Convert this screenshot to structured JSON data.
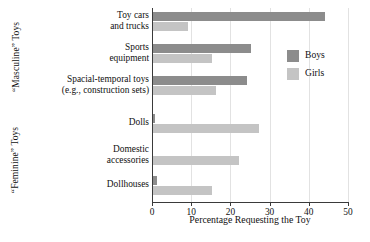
{
  "chart_data": {
    "type": "bar",
    "orientation": "horizontal",
    "title": "",
    "xlabel": "Percentage Requesting the Toy",
    "ylabel": "",
    "xlim": [
      0,
      50
    ],
    "xticks": [
      0,
      10,
      20,
      30,
      40,
      50
    ],
    "grid": true,
    "legend_position": "inside-right",
    "categories": [
      "Toy cars and trucks",
      "Sports equipment",
      "Spacial-temporal toys (e.g., construction sets)",
      "Dolls",
      "Domestic accessories",
      "Dollhouses"
    ],
    "series": [
      {
        "name": "Boys",
        "color": "#8c8c8c",
        "values": [
          44,
          25,
          24,
          0.5,
          0,
          1
        ]
      },
      {
        "name": "Girls",
        "color": "#c4c4c4",
        "values": [
          9,
          15,
          16,
          27,
          22,
          15
        ]
      }
    ]
  },
  "axis": {
    "xlabel": "Percentage Requesting the Toy",
    "ticks": [
      {
        "value": 0,
        "label": "0"
      },
      {
        "value": 10,
        "label": "10"
      },
      {
        "value": 20,
        "label": "20"
      },
      {
        "value": 30,
        "label": "30"
      },
      {
        "value": 40,
        "label": "40"
      },
      {
        "value": 50,
        "label": "50"
      }
    ]
  },
  "groups": [
    {
      "id": "masculine",
      "label": "“Masculine” Toys"
    },
    {
      "id": "feminine",
      "label": "“Feminine” Toys"
    }
  ],
  "categories": [
    {
      "line1": "Toy cars",
      "line2": "and trucks"
    },
    {
      "line1": "Sports",
      "line2": "equipment"
    },
    {
      "line1": "Spacial-temporal toys",
      "line2": "(e.g., construction sets)"
    },
    {
      "line1": "Dolls",
      "line2": ""
    },
    {
      "line1": "Domestic",
      "line2": "accessories"
    },
    {
      "line1": "Dollhouses",
      "line2": ""
    }
  ],
  "legend": {
    "items": [
      {
        "label": "Boys",
        "color": "#8c8c8c"
      },
      {
        "label": "Girls",
        "color": "#c4c4c4"
      }
    ]
  }
}
